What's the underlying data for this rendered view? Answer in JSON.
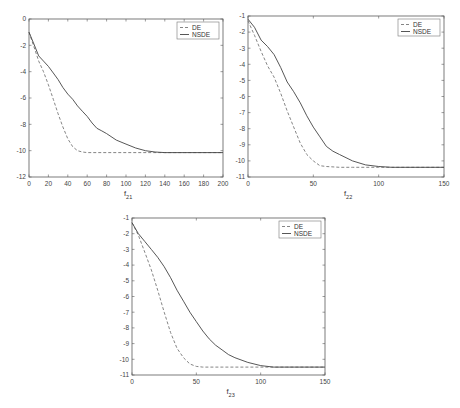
{
  "chart_data": [
    {
      "type": "line",
      "title": "",
      "xlabel": "f",
      "xlabel_sub": "21",
      "ylabel": "",
      "xlim": [
        0,
        200
      ],
      "ylim": [
        -12,
        0
      ],
      "xticks": [
        0,
        20,
        40,
        60,
        80,
        100,
        120,
        140,
        160,
        180,
        200
      ],
      "yticks": [
        0,
        -2,
        -4,
        -6,
        -8,
        -10,
        -12
      ],
      "legend": [
        "DE",
        "NSDE"
      ],
      "legend_position": "upper right",
      "grid": false,
      "box": {
        "x0": 29,
        "y0": 19,
        "x1": 223,
        "y1": 177
      },
      "series": [
        {
          "name": "DE",
          "style": "dashed",
          "x": [
            0,
            5,
            10,
            15,
            20,
            25,
            30,
            35,
            40,
            45,
            50,
            55,
            60,
            70,
            80,
            100,
            150,
            200
          ],
          "y": [
            -1.0,
            -2.1,
            -3.2,
            -4.0,
            -5.0,
            -6.1,
            -7.2,
            -8.2,
            -9.1,
            -9.7,
            -10.0,
            -10.1,
            -10.15,
            -10.15,
            -10.15,
            -10.15,
            -10.15,
            -10.15
          ]
        },
        {
          "name": "NSDE",
          "style": "solid",
          "x": [
            0,
            5,
            10,
            15,
            20,
            25,
            30,
            35,
            40,
            45,
            50,
            55,
            60,
            65,
            70,
            75,
            80,
            90,
            100,
            110,
            120,
            130,
            140,
            160,
            200
          ],
          "y": [
            -1.0,
            -1.9,
            -2.8,
            -3.2,
            -3.6,
            -4.1,
            -4.6,
            -5.2,
            -5.7,
            -6.1,
            -6.6,
            -7.0,
            -7.4,
            -7.9,
            -8.3,
            -8.5,
            -8.7,
            -9.2,
            -9.5,
            -9.8,
            -10.0,
            -10.1,
            -10.15,
            -10.15,
            -10.15
          ]
        }
      ]
    },
    {
      "type": "line",
      "title": "",
      "xlabel": "f",
      "xlabel_sub": "22",
      "ylabel": "",
      "xlim": [
        0,
        150
      ],
      "ylim": [
        -11,
        -1
      ],
      "xticks": [
        0,
        50,
        100,
        150
      ],
      "yticks": [
        -1,
        -2,
        -3,
        -4,
        -5,
        -6,
        -7,
        -8,
        -9,
        -10,
        -11
      ],
      "legend": [
        "DE",
        "NSDE"
      ],
      "legend_position": "upper right",
      "grid": false,
      "box": {
        "x0": 248,
        "y0": 16,
        "x1": 444,
        "y1": 177
      },
      "series": [
        {
          "name": "DE",
          "style": "dashed",
          "x": [
            0,
            5,
            10,
            15,
            20,
            25,
            30,
            35,
            40,
            45,
            50,
            55,
            60,
            70,
            80,
            100,
            150
          ],
          "y": [
            -1.3,
            -2.2,
            -3.2,
            -4.1,
            -4.8,
            -5.8,
            -6.9,
            -7.9,
            -8.9,
            -9.6,
            -10.0,
            -10.3,
            -10.35,
            -10.4,
            -10.4,
            -10.4,
            -10.4
          ]
        },
        {
          "name": "NSDE",
          "style": "solid",
          "x": [
            0,
            5,
            10,
            15,
            20,
            25,
            30,
            35,
            40,
            45,
            50,
            55,
            60,
            65,
            70,
            75,
            80,
            90,
            100,
            110,
            150
          ],
          "y": [
            -1.2,
            -1.7,
            -2.5,
            -2.9,
            -3.4,
            -4.2,
            -5.1,
            -5.7,
            -6.4,
            -7.2,
            -7.9,
            -8.5,
            -9.1,
            -9.4,
            -9.6,
            -9.8,
            -10.0,
            -10.25,
            -10.35,
            -10.4,
            -10.4
          ]
        }
      ]
    },
    {
      "type": "line",
      "title": "",
      "xlabel": "f",
      "xlabel_sub": "23",
      "ylabel": "",
      "xlim": [
        0,
        150
      ],
      "ylim": [
        -11,
        -1
      ],
      "xticks": [
        0,
        50,
        100,
        150
      ],
      "yticks": [
        -1,
        -2,
        -3,
        -4,
        -5,
        -6,
        -7,
        -8,
        -9,
        -10,
        -11
      ],
      "legend": [
        "DE",
        "NSDE"
      ],
      "legend_position": "upper right",
      "grid": false,
      "box": {
        "x0": 132,
        "y0": 218,
        "x1": 325,
        "y1": 375
      },
      "series": [
        {
          "name": "DE",
          "style": "dashed",
          "x": [
            0,
            5,
            10,
            15,
            20,
            25,
            30,
            35,
            40,
            45,
            50,
            55,
            60,
            70,
            100,
            150
          ],
          "y": [
            -1.3,
            -2.1,
            -3.2,
            -4.3,
            -5.6,
            -7.0,
            -8.3,
            -9.3,
            -9.9,
            -10.3,
            -10.45,
            -10.5,
            -10.5,
            -10.5,
            -10.5,
            -10.5
          ]
        },
        {
          "name": "NSDE",
          "style": "solid",
          "x": [
            0,
            5,
            10,
            15,
            20,
            25,
            30,
            35,
            40,
            45,
            50,
            55,
            60,
            65,
            70,
            75,
            80,
            90,
            100,
            110,
            120,
            150
          ],
          "y": [
            -1.3,
            -2.0,
            -2.5,
            -3.0,
            -3.5,
            -4.1,
            -4.8,
            -5.6,
            -6.3,
            -7.0,
            -7.6,
            -8.2,
            -8.7,
            -9.1,
            -9.4,
            -9.7,
            -9.9,
            -10.2,
            -10.4,
            -10.5,
            -10.5,
            -10.5
          ]
        }
      ]
    }
  ],
  "charts": [
    {
      "xlabel": "f",
      "xlabel_sub": "21",
      "legend": {
        "de": "DE",
        "nsde": "NSDE"
      }
    },
    {
      "xlabel": "f",
      "xlabel_sub": "22",
      "legend": {
        "de": "DE",
        "nsde": "NSDE"
      }
    },
    {
      "xlabel": "f",
      "xlabel_sub": "23",
      "legend": {
        "de": "DE",
        "nsde": "NSDE"
      }
    }
  ]
}
